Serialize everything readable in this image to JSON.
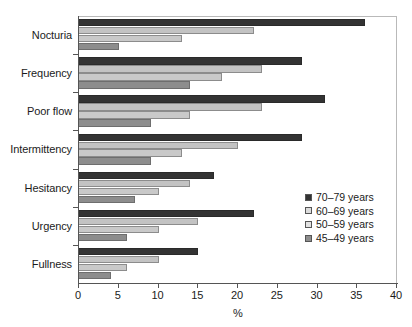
{
  "chart_data": {
    "type": "bar",
    "orientation": "horizontal",
    "title": "",
    "subtitle": "",
    "xlabel": "%",
    "ylabel": "",
    "xlim": [
      0,
      40
    ],
    "xticks": [
      0,
      5,
      10,
      15,
      20,
      25,
      30,
      35,
      40
    ],
    "grid": false,
    "legend_position": "bottom-right",
    "categories": [
      "Nocturia",
      "Frequency",
      "Poor flow",
      "Intermittency",
      "Hesitancy",
      "Urgency",
      "Fullness"
    ],
    "series": [
      {
        "name": "70–79 years",
        "color": "#333333",
        "values": [
          36,
          28,
          31,
          28,
          17,
          22,
          15
        ]
      },
      {
        "name": "60–69 years",
        "color": "#c3c3c3",
        "values": [
          22,
          23,
          23,
          20,
          14,
          15,
          10
        ]
      },
      {
        "name": "50–59 years",
        "color": "#c9c9c9",
        "values": [
          13,
          18,
          14,
          13,
          10,
          10,
          6
        ]
      },
      {
        "name": "45–49 years",
        "color": "#8d8d8d",
        "values": [
          5,
          14,
          9,
          9,
          7,
          6,
          4
        ]
      }
    ]
  },
  "axis": {
    "x_title": "%",
    "tick_labels": [
      "0",
      "5",
      "10",
      "15",
      "20",
      "25",
      "30",
      "35",
      "40"
    ]
  },
  "legend": {
    "items": [
      {
        "label": "70–79 years",
        "swatch": "legend-swatch-70-79"
      },
      {
        "label": "60–69 years",
        "swatch": "legend-swatch-60-69"
      },
      {
        "label": "50–59 years",
        "swatch": "legend-swatch-50-59"
      },
      {
        "label": "45–49 years",
        "swatch": "legend-swatch-45-49"
      }
    ]
  }
}
